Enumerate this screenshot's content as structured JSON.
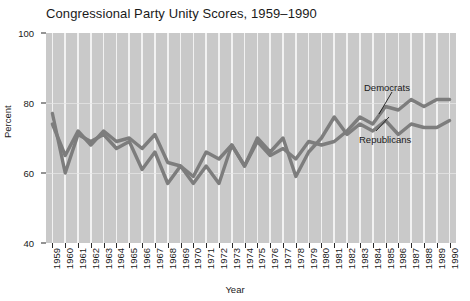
{
  "chart_data": {
    "type": "line",
    "title": "Congressional Party Unity Scores, 1959–1990",
    "xlabel": "Year",
    "ylabel": "Percent",
    "ylim": [
      40,
      100
    ],
    "yticks": [
      40,
      60,
      80,
      100
    ],
    "grid": "vertical-white-stripes-on-gray",
    "legend_position": "inline-annotations",
    "categories": [
      1959,
      1960,
      1961,
      1962,
      1963,
      1964,
      1965,
      1966,
      1967,
      1968,
      1969,
      1970,
      1971,
      1972,
      1973,
      1974,
      1975,
      1976,
      1977,
      1978,
      1979,
      1980,
      1981,
      1982,
      1983,
      1984,
      1985,
      1986,
      1987,
      1988,
      1989,
      1990
    ],
    "series": [
      {
        "name": "Democrats",
        "values": [
          77,
          60,
          71,
          69,
          71,
          67,
          69,
          61,
          66,
          57,
          62,
          57,
          62,
          57,
          68,
          62,
          69,
          65,
          67,
          64,
          69,
          68,
          69,
          72,
          76,
          74,
          79,
          78,
          81,
          79,
          81,
          81
        ]
      },
      {
        "name": "Republicans",
        "values": [
          74,
          65,
          72,
          68,
          72,
          69,
          70,
          67,
          71,
          63,
          62,
          59,
          66,
          64,
          68,
          62,
          70,
          66,
          70,
          59,
          66,
          70,
          76,
          71,
          74,
          72,
          75,
          71,
          74,
          73,
          73,
          75
        ]
      }
    ],
    "annotations": [
      {
        "label": "Democrats",
        "year": 1987
      },
      {
        "label": "Republicans",
        "year": 1986
      }
    ]
  }
}
